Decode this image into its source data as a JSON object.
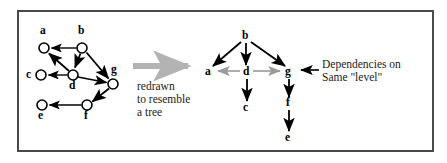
{
  "figure": {
    "frame": {
      "border_color": "#4a4a4a",
      "background": "#ffffff"
    },
    "colors": {
      "edge": "#000000",
      "node_stroke": "#000000",
      "node_fill": "#ffffff",
      "transition_arrow": "#b3b3b3",
      "same_level_arrow": "#9a9a9a",
      "text": "#1a1a1a"
    }
  },
  "left_graph": {
    "name": "original-dependency-graph",
    "nodes": [
      {
        "id": "a",
        "label": "a",
        "cx": 44,
        "cy": 48,
        "r": 5,
        "label_x": 40,
        "label_y": 30
      },
      {
        "id": "b",
        "label": "b",
        "cx": 82,
        "cy": 48,
        "r": 5,
        "label_x": 78,
        "label_y": 30
      },
      {
        "id": "c",
        "label": "c",
        "cx": 41,
        "cy": 75,
        "r": 5,
        "label_x": 27,
        "label_y": 70
      },
      {
        "id": "d",
        "label": "d",
        "cx": 73,
        "cy": 75,
        "r": 5,
        "label_x": 69,
        "label_y": 85
      },
      {
        "id": "e",
        "label": "e",
        "cx": 42,
        "cy": 105,
        "r": 5,
        "label_x": 38,
        "label_y": 115
      },
      {
        "id": "f",
        "label": "f",
        "cx": 87,
        "cy": 105,
        "r": 5,
        "label_x": 84,
        "label_y": 115
      },
      {
        "id": "g",
        "label": "g",
        "cx": 113,
        "cy": 84,
        "r": 5,
        "label_x": 112,
        "label_y": 70
      }
    ],
    "edges": [
      {
        "from": "b",
        "to": "a"
      },
      {
        "from": "b",
        "to": "d"
      },
      {
        "from": "b",
        "to": "g"
      },
      {
        "from": "d",
        "to": "a"
      },
      {
        "from": "d",
        "to": "c"
      },
      {
        "from": "d",
        "to": "g"
      },
      {
        "from": "g",
        "to": "f"
      },
      {
        "from": "f",
        "to": "e"
      }
    ]
  },
  "right_graph": {
    "name": "redrawn-tree-graph",
    "nodes": [
      {
        "id": "b",
        "label": "b",
        "x": 245,
        "y": 38
      },
      {
        "id": "a",
        "label": "a",
        "x": 209,
        "y": 74
      },
      {
        "id": "d",
        "label": "d",
        "x": 246,
        "y": 74
      },
      {
        "id": "g",
        "label": "g",
        "x": 288,
        "y": 74
      },
      {
        "id": "c",
        "label": "c",
        "x": 246,
        "y": 110
      },
      {
        "id": "f",
        "label": "f",
        "x": 288,
        "y": 105
      },
      {
        "id": "e",
        "label": "e",
        "x": 288,
        "y": 140
      }
    ],
    "tree_edges": [
      {
        "from": "b",
        "to": "a"
      },
      {
        "from": "b",
        "to": "d"
      },
      {
        "from": "b",
        "to": "g"
      },
      {
        "from": "d",
        "to": "c"
      },
      {
        "from": "g",
        "to": "f"
      },
      {
        "from": "f",
        "to": "e"
      }
    ],
    "same_level_edges": [
      {
        "from": "d",
        "to": "a"
      },
      {
        "from": "d",
        "to": "g"
      }
    ]
  },
  "annotations": {
    "transition_arrow": {
      "name": "redrawn-transition-arrow",
      "x1": 133,
      "y1": 66,
      "x2": 197,
      "y2": 66
    },
    "redrawn_caption_lines": [
      "redrawn",
      "to resemble",
      "a tree"
    ],
    "redrawn_caption": "redrawn\nto resemble\na tree",
    "dependencies_caption_lines": [
      "Dependencies on",
      "Same \"level\""
    ],
    "dependencies_caption": "Dependencies on\nSame \"level\"",
    "dependencies_pointer": {
      "name": "same-level-callout-arrow",
      "x1": 319,
      "y1": 70,
      "x2": 297,
      "y2": 70
    }
  }
}
